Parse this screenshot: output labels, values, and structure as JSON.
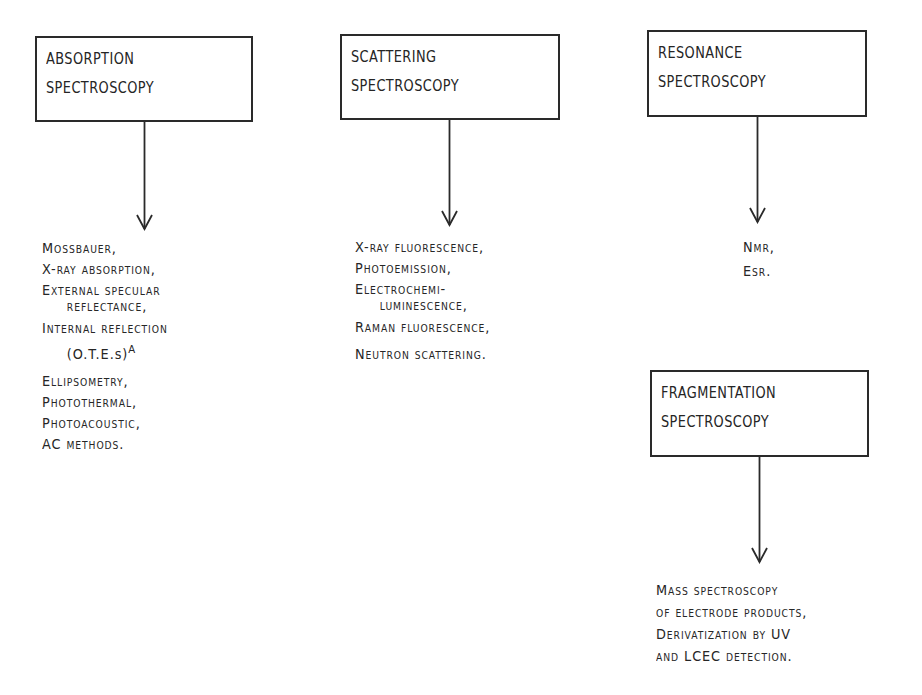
{
  "diagram": {
    "boxes": [
      {
        "id": "absorption",
        "line1": "ABSORPTION",
        "line2": "SPECTROSCOPY"
      },
      {
        "id": "scattering",
        "line1": "SCATTERING",
        "line2": "SPECTROSCOPY"
      },
      {
        "id": "resonance",
        "line1": "RESONANCE",
        "line2": "SPECTROSCOPY"
      },
      {
        "id": "fragmentation",
        "line1": "FRAGMENTATION",
        "line2": "SPECTROSCOPY"
      }
    ],
    "absorption_methods": [
      "Mossbauer,",
      "X-ray absorption,",
      "External specular",
      "reflectance,",
      "Internal reflection",
      "(O.T.E.s)",
      "Ellipsometry,",
      "Photothermal,",
      "Photoacoustic,",
      "AC methods."
    ],
    "absorption_footnote_mark": "A",
    "scattering_methods": [
      "X-ray fluorescence,",
      "Photoemission,",
      "Electrochemi-",
      "luminescence,",
      "Raman fluorescence,",
      "Neutron scattering."
    ],
    "resonance_methods": [
      "Nmr,",
      "Esr."
    ],
    "fragmentation_methods": [
      "Mass spectroscopy",
      "of electrode products,",
      "Derivatization by UV",
      "and LCEC detection."
    ],
    "colors": {
      "ink": "#222222",
      "background": "#ffffff"
    }
  }
}
